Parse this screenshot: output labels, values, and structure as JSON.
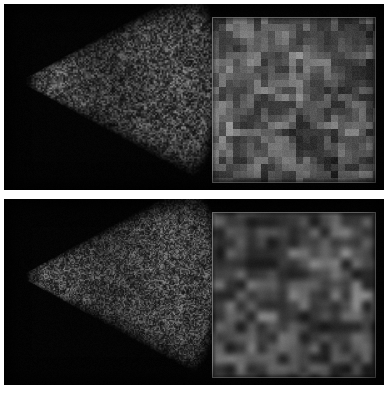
{
  "figure": {
    "title": "",
    "background_color": "#ffffff",
    "width": 388,
    "height": 393,
    "panel_background_color": "#000000"
  },
  "panels": [
    {
      "id": "panel-top",
      "label": "",
      "caption": "",
      "image_type": "ultrasound-b-mode-sector-scan",
      "background_color": "#000000",
      "sector": {
        "label": "",
        "apex_x": 14,
        "apex_y": 77,
        "radius": 206,
        "half_angle_deg": 29,
        "speckle_style": "coarse-blocky",
        "speckle_cell_px": 2,
        "mean_brightness": 58,
        "brightness_range": [
          0,
          150
        ]
      },
      "inset": {
        "label": "",
        "x": 208,
        "y": 13,
        "width": 164,
        "height": 166,
        "border_color": "#969696",
        "speckle_style": "blocky-pixelated",
        "speckle_cell_px": 7,
        "mean_brightness": 62,
        "brightness_range": [
          10,
          170
        ],
        "blur_px": 1.2
      }
    },
    {
      "id": "panel-bottom",
      "label": "",
      "caption": "",
      "image_type": "ultrasound-b-mode-sector-scan",
      "background_color": "#000000",
      "sector": {
        "label": "",
        "apex_x": 14,
        "apex_y": 77,
        "radius": 206,
        "half_angle_deg": 29,
        "speckle_style": "fine-smooth",
        "speckle_cell_px": 2,
        "mean_brightness": 60,
        "brightness_range": [
          0,
          155
        ]
      },
      "inset": {
        "label": "",
        "x": 208,
        "y": 13,
        "width": 164,
        "height": 166,
        "border_color": "#969696",
        "speckle_style": "smooth-rounded",
        "speckle_cell_px": 7,
        "mean_brightness": 64,
        "brightness_range": [
          12,
          175
        ],
        "blur_px": 3.0
      }
    }
  ],
  "colors": {
    "page_background": "#ffffff",
    "image_background": "#000000",
    "speckle_low": "#000000",
    "speckle_high": "#b4b4b4",
    "inset_border": "#969696"
  }
}
